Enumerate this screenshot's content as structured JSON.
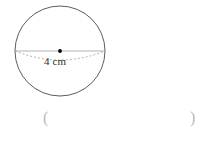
{
  "figure": {
    "type": "sphere-diagram",
    "shape_name": "circle",
    "background_color": "#ffffff",
    "outline_color": "#4a4a4a",
    "diameter_line_color": "#a8a8a8",
    "hidden_edge_color": "#9a9a9a",
    "center_dot_color": "#000000",
    "circle": {
      "center_x": 60,
      "center_y": 51,
      "radius": 45
    },
    "diameter_line": {
      "x1": 15,
      "y1": 51,
      "x2": 105,
      "y2": 51
    },
    "hidden_ellipse_arc": {
      "start_x": 15,
      "start_y": 51,
      "end_x": 105,
      "end_y": 51,
      "sag": 14,
      "dash_pattern": "2,2"
    },
    "center_dot": {
      "cx": 60,
      "cy": 51,
      "r": 1.9
    },
    "measurement_label": {
      "text": "4 cm",
      "x": 44,
      "y": 57,
      "units": "cm",
      "value": 4
    }
  },
  "answer_area": {
    "open_paren": "(",
    "close_paren": ")",
    "blank_value": "",
    "blank_placeholder": "",
    "open_paren_x": 43,
    "close_paren_x": 190,
    "baseline_y": 110
  }
}
